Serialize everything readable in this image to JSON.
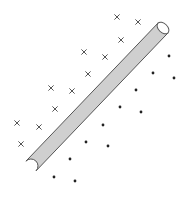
{
  "diagram": {
    "type": "linear-separator",
    "colors": {
      "background": "#ffffff",
      "rod_fill": "#cfcfcf",
      "rod_stroke": "#555555",
      "cross": "#555555",
      "dot": "#222222"
    },
    "rod": {
      "start": [
        31,
        166
      ],
      "end": [
        163,
        28
      ],
      "width": 14
    },
    "class_cross": {
      "marker": "cross-icon",
      "points": [
        [
          117,
          17
        ],
        [
          138,
          22
        ],
        [
          121,
          40
        ],
        [
          84,
          52
        ],
        [
          105,
          57
        ],
        [
          88,
          74
        ],
        [
          51,
          88
        ],
        [
          72,
          91
        ],
        [
          55,
          109
        ],
        [
          17,
          123
        ],
        [
          39,
          127
        ],
        [
          21,
          144
        ]
      ]
    },
    "class_dot": {
      "marker": "dot-icon",
      "points": [
        [
          169,
          56
        ],
        [
          153,
          73
        ],
        [
          174,
          78
        ],
        [
          136,
          90
        ],
        [
          120,
          107
        ],
        [
          141,
          112
        ],
        [
          103,
          125
        ],
        [
          86,
          142
        ],
        [
          108,
          146
        ],
        [
          70,
          159
        ],
        [
          54,
          177
        ],
        [
          75,
          181
        ]
      ]
    }
  }
}
